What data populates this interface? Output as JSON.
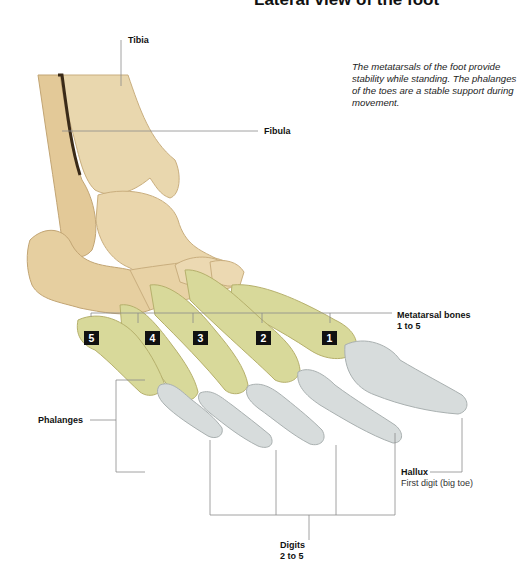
{
  "title": "Lateral view of the foot",
  "caption": "The metatarsals of the foot provide stability while standing. The phalanges of the toes are a stable support during movement.",
  "labels": {
    "tibia": "Tibia",
    "fibula": "Fibula",
    "metatarsal_title": "Metatarsal bones",
    "metatarsal_range": "1 to 5",
    "phalanges": "Phalanges",
    "hallux_title": "Hallux",
    "hallux_sub": "First digit (big toe)",
    "digits_title": "Digits",
    "digits_range": "2 to 5"
  },
  "metatarsal_numbers": [
    "5",
    "4",
    "3",
    "2",
    "1"
  ],
  "colors": {
    "bone": "#e8d3a8",
    "bone_shadow": "#c9ae7e",
    "metatarsal_highlight": "#d9dc9a",
    "phalanx_highlight": "#d5dcdc",
    "leader_line": "#8a8a8a",
    "badge": "#111111"
  }
}
